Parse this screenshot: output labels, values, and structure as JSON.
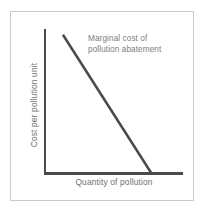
{
  "chart_data": {
    "type": "line",
    "title": "",
    "subtitle": "",
    "xlabel": "Quantity of pollution",
    "ylabel": "Cost per pollution unit",
    "grid": false,
    "legend": null,
    "legend_position": "none",
    "xlim": [
      0,
      100
    ],
    "ylim": [
      0,
      100
    ],
    "xticks": [],
    "yticks": [],
    "xticklabels": [],
    "yticklabels": [],
    "annotations": [
      {
        "name": "marginal-cost-curve-label",
        "lines": [
          "Marginal cost of",
          "pollution abatement"
        ],
        "text": "Marginal cost of pollution abatement",
        "color": "#7d7d7d"
      }
    ],
    "series": [
      {
        "name": "Marginal cost of pollution abatement",
        "type": "line",
        "color": "#4a4a4a",
        "linewidth": 2.5,
        "x": [
          13,
          77
        ],
        "y": [
          96,
          0
        ],
        "points": [
          {
            "x": 13,
            "y": 96
          },
          {
            "x": 77,
            "y": 0
          }
        ]
      }
    ],
    "axes": {
      "x_axis_color": "#4a4a4a",
      "y_axis_color": "#4a4a4a"
    }
  },
  "figure": {
    "border_color": "#c9c9c9",
    "background": "#ffffff",
    "axis_color": "#4a4a4a",
    "curve_color": "#4a4a4a",
    "text_color": "#6f6f6f",
    "annotation_color": "#7d7d7d"
  },
  "labels": {
    "x_axis_title": "Quantity of pollution",
    "y_axis_title": "Cost per pollution unit",
    "annotation_line_1": "Marginal cost of",
    "annotation_line_2": "pollution abatement"
  }
}
